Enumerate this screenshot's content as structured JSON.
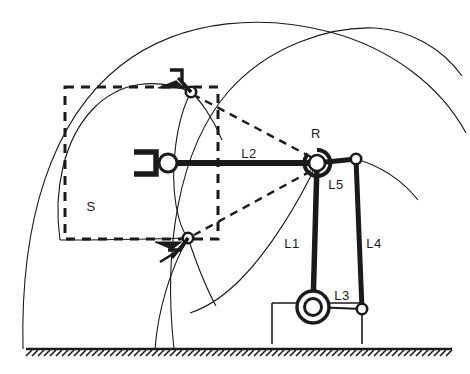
{
  "figure": {
    "background_color": "#ffffff",
    "line_color": "#1a1a1a",
    "labels": {
      "revolute_joint": "R",
      "link1": "L1",
      "link2": "L2",
      "link3": "L3",
      "link4": "L4",
      "link5": "L5",
      "workspace": "S"
    },
    "label_positions": {
      "revolute_joint": {
        "x": 316,
        "y": 138
      },
      "link2": {
        "x": 249,
        "y": 155
      },
      "link5": {
        "x": 336,
        "y": 187
      },
      "link1": {
        "x": 290,
        "y": 245
      },
      "link4": {
        "x": 372,
        "y": 245
      },
      "link3": {
        "x": 341,
        "y": 297
      },
      "workspace": {
        "x": 90,
        "y": 207
      }
    },
    "joints": [
      {
        "name": "revolute-joint-R",
        "x": 317,
        "y": 163,
        "type": "double-ring",
        "outer_r": 11,
        "inner_r": 7
      },
      {
        "name": "base-pivot",
        "x": 313,
        "y": 307,
        "type": "double-ring",
        "outer_r": 16,
        "inner_r": 9
      },
      {
        "name": "l5-l4-joint",
        "x": 356,
        "y": 159,
        "type": "small-circle",
        "r": 5
      },
      {
        "name": "l4-l3-joint",
        "x": 362,
        "y": 309,
        "type": "small-circle",
        "r": 5
      },
      {
        "name": "tool-pivot",
        "x": 168,
        "y": 163,
        "type": "medium-circle",
        "r": 9
      },
      {
        "name": "upper-effector-joint",
        "x": 191,
        "y": 92,
        "type": "small-circle",
        "r": 5
      },
      {
        "name": "lower-effector-joint",
        "x": 188,
        "y": 238,
        "type": "small-circle",
        "r": 5
      }
    ],
    "links": [
      {
        "name": "link-L2",
        "from": [
          168,
          163
        ],
        "to": [
          317,
          163
        ],
        "width": 5
      },
      {
        "name": "link-L1",
        "from": [
          317,
          163
        ],
        "to": [
          313,
          307
        ],
        "width": 5
      },
      {
        "name": "link-L5",
        "from": [
          317,
          163
        ],
        "to": [
          356,
          159
        ],
        "width": 5
      },
      {
        "name": "link-L4",
        "from": [
          356,
          159
        ],
        "to": [
          362,
          309
        ],
        "width": 5
      }
    ],
    "construction_lines": [
      {
        "name": "dashed-R-to-upper",
        "from": [
          317,
          163
        ],
        "to": [
          191,
          92
        ]
      },
      {
        "name": "dashed-R-to-lower",
        "from": [
          317,
          163
        ],
        "to": [
          188,
          238
        ]
      }
    ],
    "workspace_box": {
      "x": 65,
      "y": 87,
      "width": 153,
      "height": 152,
      "style": "dashed"
    },
    "ground": {
      "y": 349,
      "x_start": 26,
      "x_end": 452,
      "hatch": true
    },
    "base": {
      "x_left": 272,
      "x_right": 362,
      "y_top": 303,
      "y_bottom": 344
    }
  }
}
